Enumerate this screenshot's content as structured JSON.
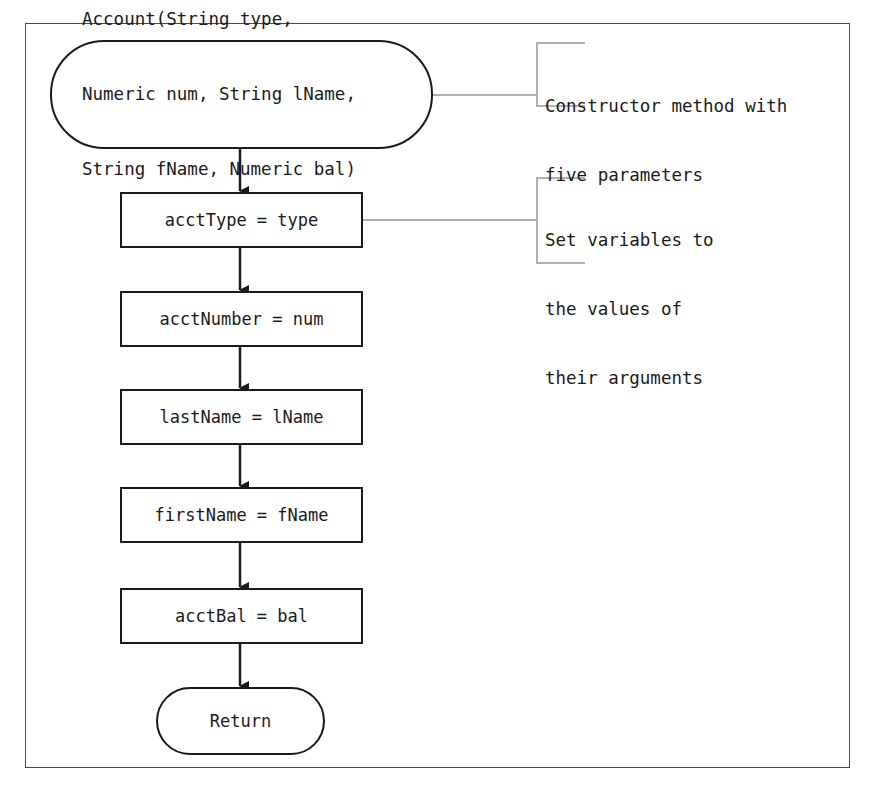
{
  "diagram": {
    "type": "flowchart",
    "start": {
      "lines": [
        "Account(String type,",
        "Numeric num, String lName,",
        "String fName, Numeric bal)"
      ]
    },
    "steps": [
      {
        "label": "acctType = type"
      },
      {
        "label": "acctNumber = num"
      },
      {
        "label": "lastName = lName"
      },
      {
        "label": "firstName = fName"
      },
      {
        "label": "acctBal = bal"
      }
    ],
    "end": {
      "label": "Return"
    },
    "annotations": [
      {
        "lines": [
          "Constructor method with",
          "five parameters"
        ],
        "points_to": "start"
      },
      {
        "lines": [
          "Set variables to",
          "the values of",
          "their arguments"
        ],
        "points_to": "steps.0"
      }
    ],
    "colors": {
      "stroke": "#1a1a1a",
      "annotation_line": "#b0b0b0",
      "frame": "#4a4a4a",
      "background": "#ffffff"
    }
  }
}
